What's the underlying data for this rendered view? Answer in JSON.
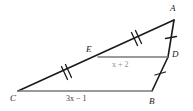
{
  "figure": {
    "type": "geometry-diagram",
    "vertices": [
      {
        "id": "A",
        "label": "A",
        "x": 174,
        "y": 20
      },
      {
        "id": "B",
        "label": "B",
        "x": 152,
        "y": 91
      },
      {
        "id": "C",
        "label": "C",
        "x": 18,
        "y": 91
      },
      {
        "id": "D",
        "label": "D",
        "x": 168,
        "y": 57
      },
      {
        "id": "E",
        "label": "E",
        "x": 98,
        "y": 57
      }
    ],
    "segments": [
      {
        "id": "CA",
        "from": "C",
        "to": "A",
        "ticks": 2,
        "color": "#1a1a1a"
      },
      {
        "id": "AB",
        "from": "A",
        "to": "B",
        "ticks": 1,
        "color": "#1a1a1a"
      },
      {
        "id": "CB",
        "from": "C",
        "to": "B",
        "ticks": 0,
        "color": "#7a7a7a"
      },
      {
        "id": "ED",
        "from": "E",
        "to": "D",
        "ticks": 0,
        "color": "#7a7a7a"
      }
    ],
    "segment_labels": {
      "midsegment": "x + 2",
      "base": "3x − 1"
    },
    "tick_marks": {
      "AE_count": 2,
      "CE_count": 2,
      "AD_count": 1,
      "DB_count": 1
    },
    "colors": {
      "stroke_dark": "#1a1a1a",
      "stroke_gray": "#7a7a7a",
      "label_dark": "#222222",
      "label_gray": "#8d8d8d",
      "background": "#ffffff"
    }
  }
}
